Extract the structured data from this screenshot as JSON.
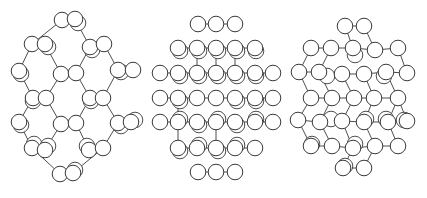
{
  "figure": {
    "stroke_color": "#3a3a3a",
    "fill_color": "#ffffff",
    "atom_radius": 7.8
  },
  "structures": [
    {
      "name": "structure-left",
      "atoms": [
        [
          62,
          20
        ],
        [
          75,
          19
        ],
        [
          32,
          44
        ],
        [
          45,
          44
        ],
        [
          90,
          47
        ],
        [
          104,
          44
        ],
        [
          19,
          71
        ],
        [
          61,
          74
        ],
        [
          76,
          73
        ],
        [
          118,
          70
        ],
        [
          133,
          70
        ],
        [
          33,
          98
        ],
        [
          46,
          98
        ],
        [
          90,
          98
        ],
        [
          103,
          98
        ],
        [
          19,
          122
        ],
        [
          61,
          124
        ],
        [
          76,
          123
        ],
        [
          118,
          123
        ],
        [
          131,
          122
        ],
        [
          32,
          148
        ],
        [
          45,
          150
        ],
        [
          89,
          150
        ],
        [
          103,
          148
        ],
        [
          60,
          174
        ],
        [
          73,
          173
        ]
      ],
      "shadows": [
        [
          78,
          23
        ],
        [
          48,
          47
        ],
        [
          92,
          50
        ],
        [
          21,
          74
        ],
        [
          121,
          72
        ],
        [
          33,
          101
        ],
        [
          91,
          101
        ],
        [
          21,
          125
        ],
        [
          121,
          126
        ],
        [
          135,
          120
        ],
        [
          34,
          144
        ],
        [
          48,
          146
        ],
        [
          87,
          146
        ],
        [
          75,
          170
        ]
      ],
      "bonds": [
        [
          0,
          2
        ],
        [
          1,
          4
        ],
        [
          2,
          6
        ],
        [
          3,
          7
        ],
        [
          4,
          8
        ],
        [
          5,
          9
        ],
        [
          6,
          11
        ],
        [
          7,
          12
        ],
        [
          8,
          13
        ],
        [
          9,
          14
        ],
        [
          10,
          9
        ],
        [
          11,
          15
        ],
        [
          12,
          16
        ],
        [
          13,
          17
        ],
        [
          14,
          18
        ],
        [
          15,
          20
        ],
        [
          16,
          21
        ],
        [
          17,
          22
        ],
        [
          18,
          23
        ],
        [
          19,
          18
        ],
        [
          20,
          24
        ],
        [
          23,
          25
        ]
      ]
    },
    {
      "name": "structure-middle",
      "atoms": [
        [
          198,
          24
        ],
        [
          216,
          24
        ],
        [
          235,
          24
        ],
        [
          178,
          48
        ],
        [
          197,
          48
        ],
        [
          216,
          48
        ],
        [
          235,
          48
        ],
        [
          255,
          48
        ],
        [
          160,
          73
        ],
        [
          178,
          73
        ],
        [
          197,
          73
        ],
        [
          216,
          73
        ],
        [
          235,
          73
        ],
        [
          255,
          73
        ],
        [
          273,
          73
        ],
        [
          160,
          98
        ],
        [
          178,
          98
        ],
        [
          197,
          98
        ],
        [
          216,
          98
        ],
        [
          235,
          98
        ],
        [
          255,
          98
        ],
        [
          273,
          98
        ],
        [
          160,
          122
        ],
        [
          178,
          122
        ],
        [
          197,
          122
        ],
        [
          216,
          122
        ],
        [
          235,
          122
        ],
        [
          255,
          122
        ],
        [
          273,
          122
        ],
        [
          178,
          148
        ],
        [
          197,
          148
        ],
        [
          216,
          148
        ],
        [
          235,
          148
        ],
        [
          255,
          148
        ],
        [
          198,
          172
        ],
        [
          216,
          172
        ],
        [
          235,
          172
        ]
      ],
      "shadows": [
        [
          180,
          51
        ],
        [
          199,
          51
        ],
        [
          218,
          51
        ],
        [
          237,
          51
        ],
        [
          256,
          51
        ],
        [
          180,
          76
        ],
        [
          199,
          76
        ],
        [
          218,
          76
        ],
        [
          237,
          76
        ],
        [
          256,
          76
        ],
        [
          180,
          101
        ],
        [
          237,
          101
        ],
        [
          256,
          101
        ],
        [
          180,
          119
        ],
        [
          199,
          125
        ],
        [
          218,
          119
        ],
        [
          237,
          125
        ],
        [
          256,
          119
        ],
        [
          180,
          151
        ],
        [
          199,
          145
        ],
        [
          218,
          151
        ],
        [
          237,
          145
        ]
      ],
      "bonds": [
        [
          0,
          1
        ],
        [
          1,
          2
        ],
        [
          3,
          4
        ],
        [
          4,
          5
        ],
        [
          5,
          6
        ],
        [
          6,
          7
        ],
        [
          8,
          9
        ],
        [
          9,
          10
        ],
        [
          10,
          11
        ],
        [
          11,
          12
        ],
        [
          12,
          13
        ],
        [
          13,
          14
        ],
        [
          15,
          16
        ],
        [
          16,
          17
        ],
        [
          17,
          18
        ],
        [
          18,
          19
        ],
        [
          19,
          20
        ],
        [
          20,
          21
        ],
        [
          22,
          23
        ],
        [
          23,
          24
        ],
        [
          24,
          25
        ],
        [
          25,
          26
        ],
        [
          26,
          27
        ],
        [
          27,
          28
        ],
        [
          29,
          30
        ],
        [
          30,
          31
        ],
        [
          31,
          32
        ],
        [
          32,
          33
        ],
        [
          34,
          35
        ],
        [
          35,
          36
        ],
        [
          4,
          10
        ],
        [
          5,
          11
        ],
        [
          6,
          12
        ],
        [
          16,
          23
        ],
        [
          29,
          23
        ],
        [
          31,
          25
        ]
      ]
    },
    {
      "name": "structure-right",
      "atoms": [
        [
          345,
          26
        ],
        [
          364,
          26
        ],
        [
          311,
          48
        ],
        [
          331,
          48
        ],
        [
          353,
          48
        ],
        [
          375,
          50
        ],
        [
          398,
          48
        ],
        [
          299,
          72
        ],
        [
          319,
          72
        ],
        [
          342,
          74
        ],
        [
          364,
          74
        ],
        [
          386,
          72
        ],
        [
          407,
          73
        ],
        [
          311,
          98
        ],
        [
          332,
          98
        ],
        [
          354,
          98
        ],
        [
          374,
          98
        ],
        [
          398,
          98
        ],
        [
          298,
          120
        ],
        [
          320,
          122
        ],
        [
          342,
          121
        ],
        [
          364,
          122
        ],
        [
          388,
          122
        ],
        [
          407,
          121
        ],
        [
          311,
          146
        ],
        [
          332,
          146
        ],
        [
          353,
          148
        ],
        [
          375,
          146
        ],
        [
          398,
          146
        ],
        [
          343,
          168
        ],
        [
          364,
          168
        ]
      ],
      "shadows": [
        [
          355,
          55
        ],
        [
          327,
          76
        ],
        [
          384,
          76
        ],
        [
          331,
          119
        ],
        [
          366,
          119
        ],
        [
          386,
          119
        ],
        [
          404,
          120
        ],
        [
          312,
          144
        ],
        [
          355,
          144
        ],
        [
          345,
          166
        ]
      ],
      "bonds": [
        [
          0,
          1
        ],
        [
          2,
          3
        ],
        [
          3,
          4
        ],
        [
          4,
          5
        ],
        [
          5,
          6
        ],
        [
          7,
          8
        ],
        [
          8,
          9
        ],
        [
          9,
          10
        ],
        [
          10,
          11
        ],
        [
          11,
          12
        ],
        [
          13,
          14
        ],
        [
          14,
          15
        ],
        [
          15,
          16
        ],
        [
          16,
          17
        ],
        [
          18,
          19
        ],
        [
          19,
          20
        ],
        [
          20,
          21
        ],
        [
          21,
          22
        ],
        [
          22,
          23
        ],
        [
          24,
          25
        ],
        [
          25,
          26
        ],
        [
          26,
          27
        ],
        [
          27,
          28
        ],
        [
          29,
          30
        ],
        [
          0,
          4
        ],
        [
          1,
          5
        ],
        [
          2,
          7
        ],
        [
          3,
          8
        ],
        [
          6,
          12
        ],
        [
          7,
          13
        ],
        [
          8,
          14
        ],
        [
          9,
          15
        ],
        [
          10,
          16
        ],
        [
          11,
          17
        ],
        [
          13,
          18
        ],
        [
          14,
          19
        ],
        [
          15,
          20
        ],
        [
          16,
          21
        ],
        [
          17,
          22
        ],
        [
          17,
          23
        ],
        [
          18,
          24
        ],
        [
          19,
          25
        ],
        [
          20,
          26
        ],
        [
          21,
          27
        ],
        [
          22,
          28
        ],
        [
          26,
          29
        ],
        [
          27,
          30
        ]
      ]
    }
  ]
}
